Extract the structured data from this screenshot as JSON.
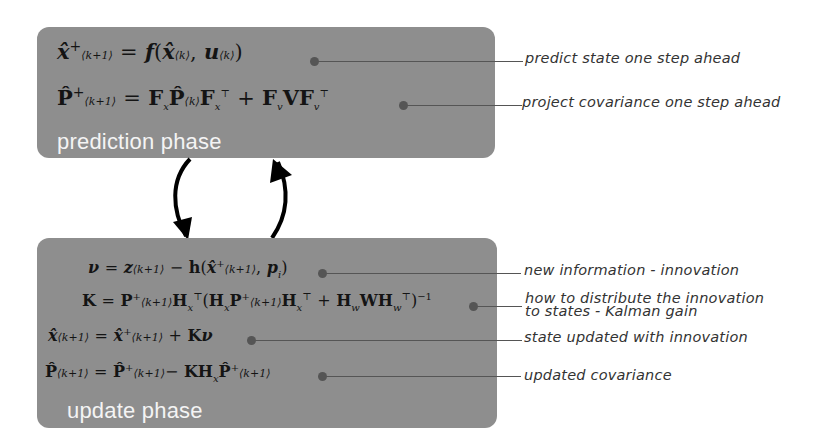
{
  "prediction_phase": {
    "label": "prediction phase",
    "equations": [
      {
        "id": "state-predict",
        "text": "x̂⁺⟨k+1⟩ = f(x̂⟨k⟩, u⟨k⟩)",
        "annotation": "predict state one step ahead"
      },
      {
        "id": "covariance-predict",
        "text": "P̂⁺⟨k+1⟩ = Fₓ P̂⟨k⟩ Fₓᵀ + Fᵥ V Fᵥᵀ",
        "annotation": "project covariance one step ahead"
      }
    ]
  },
  "update_phase": {
    "label": "update phase",
    "equations": [
      {
        "id": "innovation",
        "text": "ν = z⟨k+1⟩ − h(x̂⁺⟨k+1⟩, pᵢ)",
        "annotation": "new information - innovation"
      },
      {
        "id": "kalman-gain",
        "text": "K = P⁺⟨k+1⟩ Hₓᵀ (Hₓ P⁺⟨k+1⟩ Hₓᵀ + H_w W H_wᵀ)⁻¹",
        "annotation_line1": "how to distribute the innovation",
        "annotation_line2": "to states - Kalman gain"
      },
      {
        "id": "state-update",
        "text": "x̂⟨k+1⟩ = x̂⁺⟨k+1⟩ + Kν",
        "annotation": "state updated with innovation"
      },
      {
        "id": "covariance-update",
        "text": "P̂⟨k+1⟩ = P̂⁺⟨k+1⟩ − K Hₓ P̂⁺⟨k+1⟩",
        "annotation": "updated covariance"
      }
    ]
  },
  "colors": {
    "box_fill": "#8e8e8e",
    "label_text": "#f4f4f4",
    "leader": "#555555",
    "arrow": "#000000"
  }
}
